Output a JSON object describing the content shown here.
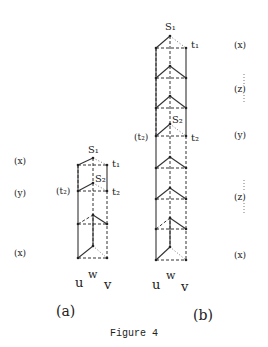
{
  "figure": {
    "caption": "Figure 4",
    "panel_a": {
      "label": "(a)",
      "top_label": "S₁",
      "t1_label": "t₁",
      "s2_label": "S₂",
      "t2_left_label": "(t₂)",
      "t2_right_label": "t₂",
      "bottom_labels": {
        "u": "u",
        "w": "w",
        "v": "v"
      },
      "side_labels": [
        "(x)",
        "(y)",
        "(x)"
      ]
    },
    "panel_b": {
      "label": "(b)",
      "top_label": "S₁",
      "t1_label": "t₁",
      "s2_label": "S₂",
      "t2_left_label": "(t₂)",
      "t2_right_label": "t₂",
      "bottom_labels": {
        "u": "u",
        "w": "w",
        "v": "v"
      },
      "side_labels": [
        "(x)",
        "(z)",
        "(y)",
        "(z)",
        "(x)"
      ]
    }
  }
}
